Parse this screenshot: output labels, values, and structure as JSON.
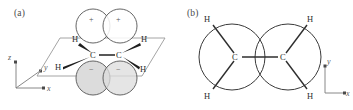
{
  "figure": {
    "caption_type": "chemical-structure-diagram",
    "molecule": "ethylene pi bond",
    "panels": [
      {
        "id": "a",
        "label": "(a)",
        "view": "perspective",
        "axes": [
          {
            "name": "z",
            "label": "z",
            "direction": "up"
          },
          {
            "name": "y",
            "label": "y",
            "direction": "depth"
          },
          {
            "name": "x",
            "label": "x",
            "direction": "right"
          }
        ],
        "atoms": [
          {
            "label": "C",
            "name": "carbon-left"
          },
          {
            "label": "C",
            "name": "carbon-right"
          },
          {
            "label": "H",
            "name": "hydrogen-upper-left"
          },
          {
            "label": "H",
            "name": "hydrogen-upper-right"
          },
          {
            "label": "H",
            "name": "hydrogen-lower-left"
          },
          {
            "label": "H",
            "name": "hydrogen-lower-right"
          }
        ],
        "orbital_lobes": [
          {
            "sign": "+",
            "name": "p-lobe-top-left",
            "fill": "#ffffff"
          },
          {
            "sign": "+",
            "name": "p-lobe-top-right",
            "fill": "#ffffff"
          },
          {
            "sign": "−",
            "name": "p-lobe-bottom-left",
            "fill": "#dcdcdc"
          },
          {
            "sign": "−",
            "name": "p-lobe-bottom-right",
            "fill": "#dcdcdc"
          }
        ],
        "plane": {
          "name": "sigma-framework-plane",
          "shape": "parallelogram"
        }
      },
      {
        "id": "b",
        "label": "(b)",
        "view": "front",
        "axes": [
          {
            "name": "y",
            "label": "y",
            "direction": "up"
          },
          {
            "name": "x",
            "label": "x",
            "direction": "right"
          }
        ],
        "atoms": [
          {
            "label": "C",
            "name": "carbon-left"
          },
          {
            "label": "C",
            "name": "carbon-right"
          },
          {
            "label": "H",
            "name": "hydrogen-top-left"
          },
          {
            "label": "H",
            "name": "hydrogen-top-right"
          },
          {
            "label": "H",
            "name": "hydrogen-bottom-left"
          },
          {
            "label": "H",
            "name": "hydrogen-bottom-right"
          }
        ],
        "orbital_lobes": [
          {
            "name": "pi-circle-left",
            "fill": "#ffffff"
          },
          {
            "name": "pi-circle-right",
            "fill": "#ffffff"
          }
        ]
      }
    ],
    "colors": {
      "background": "#ffffff",
      "stroke": "#4a4a4a",
      "bond": "#2e2e2e",
      "lobe_shaded": "#dcdcdc",
      "text": "#3a3a3a"
    }
  }
}
